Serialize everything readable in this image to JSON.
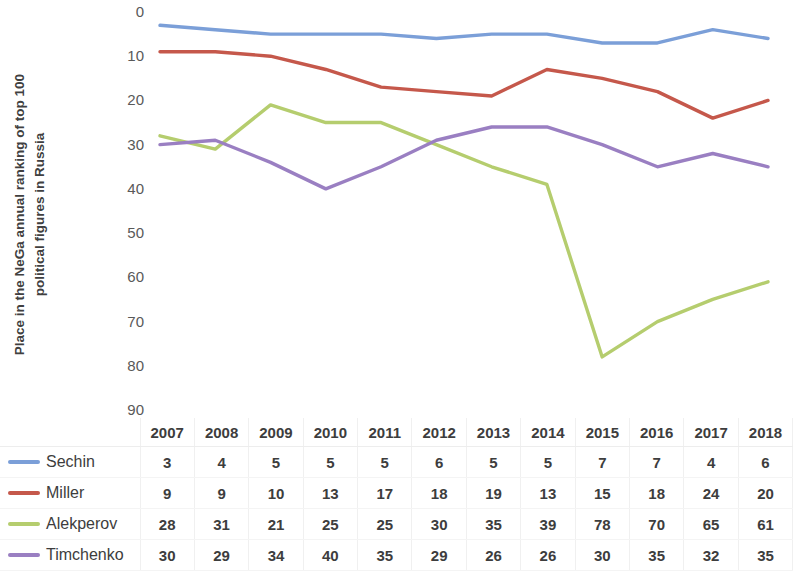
{
  "axis": {
    "y_title_line1": "Place in the NeGa annual ranking of top 100",
    "y_title_line2": "political figures in Russia",
    "y_ticks": [
      "0",
      "10",
      "20",
      "30",
      "40",
      "50",
      "60",
      "70",
      "80",
      "90"
    ],
    "corner_label": ""
  },
  "chart_data": {
    "type": "line",
    "title": "",
    "subtitle": "",
    "xlabel": "",
    "ylabel": "Place in the NeGa annual ranking of top 100 political figures in Russia",
    "categories": [
      "2007",
      "2008",
      "2009",
      "2010",
      "2011",
      "2012",
      "2013",
      "2014",
      "2015",
      "2016",
      "2017",
      "2018"
    ],
    "ylim": [
      0,
      90
    ],
    "y_inverted": true,
    "y_tick_step": 10,
    "grid": false,
    "legend_position": "bottom-left-table",
    "markers": false,
    "series": [
      {
        "name": "Sechin",
        "color": "#7b9fd8",
        "values": [
          3,
          4,
          5,
          5,
          5,
          6,
          5,
          5,
          7,
          7,
          4,
          6
        ]
      },
      {
        "name": "Miller",
        "color": "#c5584b",
        "values": [
          9,
          9,
          10,
          13,
          17,
          18,
          19,
          13,
          15,
          18,
          24,
          20
        ]
      },
      {
        "name": "Alekperov",
        "color": "#b5cd6e",
        "values": [
          28,
          31,
          21,
          25,
          25,
          30,
          35,
          39,
          78,
          70,
          65,
          61
        ]
      },
      {
        "name": "Timchenko",
        "color": "#9a7fc2",
        "values": [
          30,
          29,
          34,
          40,
          35,
          29,
          26,
          26,
          30,
          35,
          32,
          35
        ]
      }
    ]
  }
}
